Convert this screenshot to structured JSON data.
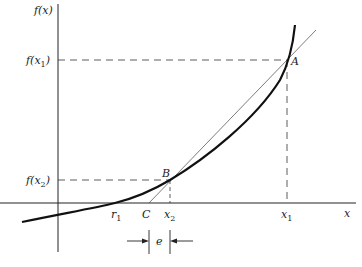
{
  "diagram": {
    "type": "secant-method-illustration",
    "axes": {
      "y_label": "f(x)",
      "x_label": "x"
    },
    "y_ticks": [
      {
        "id": "fx1",
        "label_main": "f(",
        "label_var": "x",
        "label_sub": "1",
        "label_close": ")"
      },
      {
        "id": "fx2",
        "label_main": "f(",
        "label_var": "x",
        "label_sub": "2",
        "label_close": ")"
      }
    ],
    "x_ticks": [
      {
        "id": "r1",
        "var": "r",
        "sub": "1"
      },
      {
        "id": "C",
        "var": "C",
        "sub": ""
      },
      {
        "id": "x2",
        "var": "x",
        "sub": "2"
      },
      {
        "id": "x1",
        "var": "x",
        "sub": "1"
      }
    ],
    "points": [
      {
        "id": "A",
        "label": "A"
      },
      {
        "id": "B",
        "label": "B"
      }
    ],
    "error_marker": {
      "label": "e"
    },
    "colors": {
      "curve": "#111111",
      "secant": "#444444",
      "axes": "#222222",
      "dashed": "#333333"
    }
  }
}
